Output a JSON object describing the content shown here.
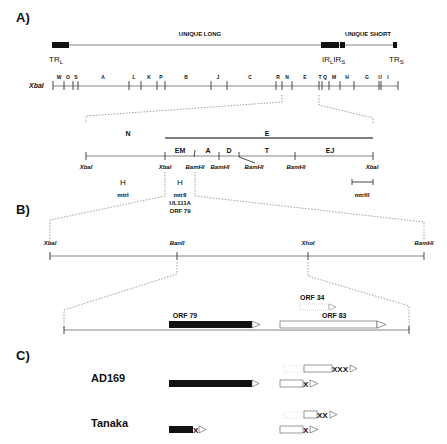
{
  "panels": {
    "a_label": "A)",
    "b_label": "B)",
    "c_label": "C)"
  },
  "genome": {
    "unique_long": "UNIQUE LONG",
    "unique_short": "UNIQUE SHORT",
    "tr_l": "TR",
    "tr_l_sub": "L",
    "ir_l": "IR",
    "ir_l_sub": "L",
    "ir_s": "IR",
    "ir_s_sub": "S",
    "tr_s": "TR",
    "tr_s_sub": "S"
  },
  "xbai_map": {
    "enzyme": "XbaI",
    "fragments": [
      "W",
      "O",
      "S",
      "A",
      "L",
      "K",
      "P",
      "B",
      "J",
      "C",
      "R",
      "N",
      "E",
      "T",
      "Q",
      "M",
      "H",
      "G",
      "U",
      "I"
    ]
  },
  "detail_map": {
    "top_labels": [
      "N",
      "E"
    ],
    "sub_fragments": [
      "EM",
      "A",
      "D",
      "T",
      "EJ"
    ],
    "sites": [
      "XbaI",
      "XbaI",
      "BamHI",
      "BamHI",
      "BamHI",
      "BamHI",
      "XbaI"
    ],
    "mtr": [
      "mtrI",
      "mtrII",
      "mtrIII"
    ],
    "mtr_h": "H",
    "gene1": "UL111A",
    "gene2": "ORF 79"
  },
  "panel_b": {
    "sites": [
      "XbaI",
      "BanII",
      "XhoI",
      "BamHI"
    ],
    "orfs": [
      "ORF 79",
      "ORF 34",
      "ORF 83"
    ]
  },
  "panel_c": {
    "strains": [
      "AD169",
      "Tanaka"
    ],
    "stop_ad169_top": "XXX",
    "stop_ad169_bottom": "X",
    "stop_tanaka_orf79": "X",
    "stop_tanaka_top": "XX",
    "stop_tanaka_bottom": "X"
  }
}
